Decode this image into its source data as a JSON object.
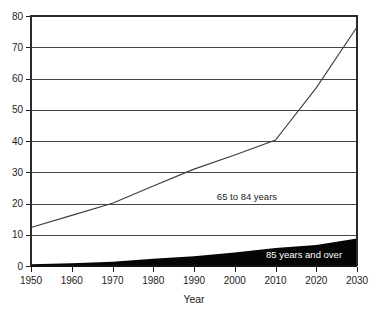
{
  "chart_data": {
    "type": "area",
    "title": "",
    "subtitle": "",
    "xlabel": "Year",
    "ylabel": "",
    "xlim": [
      1950,
      2030
    ],
    "ylim": [
      0,
      80
    ],
    "grid": true,
    "grid_axis": "y",
    "legend_position": "inline-annotation",
    "x": [
      1950,
      1960,
      1970,
      1980,
      1990,
      2000,
      2010,
      2020,
      2030
    ],
    "xtick_labels": [
      "1950",
      "1960",
      "1970",
      "1980",
      "1990",
      "2000",
      "2010",
      "2020",
      "2030"
    ],
    "ytick_values": [
      0,
      10,
      20,
      30,
      40,
      50,
      60,
      70,
      80
    ],
    "ytick_labels": [
      "0",
      "10",
      "20",
      "30",
      "40",
      "50",
      "60",
      "70",
      "80"
    ],
    "series": [
      {
        "name": "65 to 84 years",
        "style": "line",
        "color": "#3c3c3c",
        "values": [
          12.3,
          16.2,
          20.1,
          25.6,
          31.0,
          35.5,
          40.3,
          57.0,
          76.5
        ],
        "annotation": {
          "text": "65 to 84 years",
          "x": 2003,
          "y": 21,
          "color": "#1c1c1c"
        }
      },
      {
        "name": "85 years and over",
        "style": "filled-area",
        "color": "#050505",
        "values": [
          0.6,
          0.9,
          1.4,
          2.3,
          3.1,
          4.3,
          5.8,
          6.7,
          8.8
        ],
        "annotation": {
          "text": "85 years and over",
          "x": 2017,
          "y": 2.6,
          "color": "#ffffff"
        }
      }
    ],
    "axis": {
      "left_label_0": "0",
      "left_label_80": "80"
    }
  }
}
